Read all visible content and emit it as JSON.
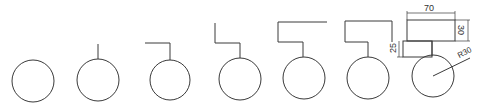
{
  "diagram": {
    "type": "stepwise-construction-sequence",
    "stroke_color": "#333333",
    "background": "#ffffff",
    "steps": [
      {
        "step": 1,
        "description": "circle"
      },
      {
        "step": 2,
        "description": "circle with vertical stem"
      },
      {
        "step": 3,
        "description": "stem with horizontal arm"
      },
      {
        "step": 4,
        "description": "stem, arm, upward segment"
      },
      {
        "step": 5,
        "description": "adds top horizontal line"
      },
      {
        "step": 6,
        "description": "adds right vertical line closing top box"
      },
      {
        "step": 7,
        "description": "completed figure with dimensions"
      }
    ],
    "dimensions": {
      "top_width": "70",
      "top_height": "30",
      "middle_height": "25",
      "radius": "R30"
    }
  }
}
